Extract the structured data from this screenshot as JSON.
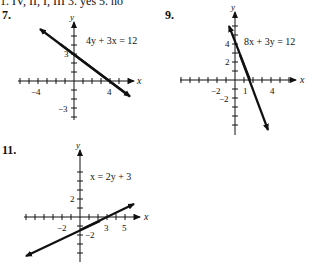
{
  "header_line": "1. IV, II, I, III     3. yes     5. no",
  "problems": [
    {
      "number": "7.",
      "equation": "4y + 3x = 12",
      "x_ticks": [
        "−4",
        "4"
      ],
      "y_ticks": [
        "3",
        "−3"
      ]
    },
    {
      "number": "9.",
      "equation": "8x + 3y = 12",
      "x_ticks": [
        "−2",
        "1",
        "4"
      ],
      "y_ticks": [
        "4",
        "2",
        "−2"
      ]
    },
    {
      "number": "11.",
      "equation": "x = 2y + 3",
      "x_ticks": [
        "−2",
        "3",
        "5"
      ],
      "y_ticks": [
        "2",
        "−2"
      ]
    }
  ],
  "axis_labels": {
    "x": "x",
    "y": "y"
  }
}
